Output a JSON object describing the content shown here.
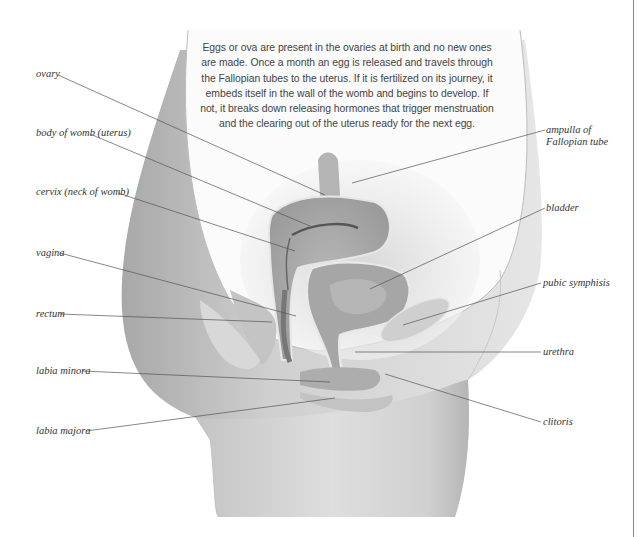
{
  "caption": {
    "text": "Eggs or ova are present in the ovaries at birth and no new ones are made. Once a month an egg is released and travels through the Fallopian tubes to the uterus. If it is fertilized on its journey, it embeds itself in the wall of the womb and begins to develop. If not, it breaks down releasing hormones that trigger menstruation and the clearing out of the uterus ready for the next egg."
  },
  "labels": {
    "left": [
      {
        "id": "ovary",
        "text": "ovary"
      },
      {
        "id": "body-of-womb",
        "text": "body of womb (uterus)"
      },
      {
        "id": "cervix",
        "text": "cervix (neck of womb)"
      },
      {
        "id": "vagina",
        "text": "vagina"
      },
      {
        "id": "rectum",
        "text": "rectum"
      },
      {
        "id": "labia-minora",
        "text": "labia minora"
      },
      {
        "id": "labia-majora",
        "text": "labia majora"
      }
    ],
    "right": [
      {
        "id": "ampulla",
        "line1": "ampulla of",
        "line2": "Fallopian tube"
      },
      {
        "id": "bladder",
        "text": "bladder"
      },
      {
        "id": "pubic-symphysis",
        "text": "pubic symphisis"
      },
      {
        "id": "urethra",
        "text": "urethra"
      },
      {
        "id": "clitoris",
        "text": "clitoris"
      }
    ]
  },
  "colors": {
    "skin_shade": "#bdbdbd",
    "organ": "#a9a9a9",
    "leader": "#555555",
    "text": "#333333"
  }
}
